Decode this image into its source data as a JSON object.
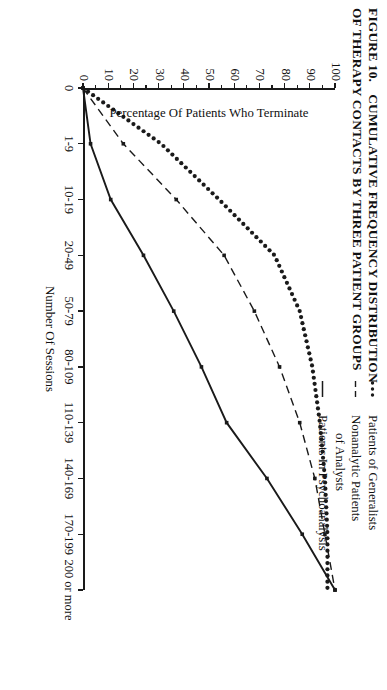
{
  "title": {
    "figure_number": "FIGURE 10.",
    "line1": "CUMULATIVE FREQUENCY DISTRIBUTION",
    "line2": "OF THERAPY CONTACTS BY THREE PATIENT GROUPS"
  },
  "axes": {
    "x_title": "Number Of Sessions",
    "y_title": "Percentage Of Patients Who Terminate",
    "x_categories": [
      "0",
      "1-9",
      "10-19",
      "20-49",
      "50-79",
      "80-109",
      "110-139",
      "140-169",
      "170-199",
      "200 or more"
    ],
    "y_ticks": [
      "0",
      "10",
      "20",
      "30",
      "40",
      "50",
      "60",
      "70",
      "80",
      "90",
      "100"
    ],
    "y_min": 0,
    "y_max": 100,
    "y_minor_step": 5
  },
  "legend": {
    "items": [
      {
        "marker": "dotted",
        "label_line1": "Patients of Generalists",
        "label_line2": ""
      },
      {
        "marker": "dashed",
        "label_line1": "Nonanalytic Patients",
        "label_line2": "of Analysts"
      },
      {
        "marker": "solid",
        "label_line1": "Patients In Psychoanalysis",
        "label_line2": ""
      }
    ]
  },
  "colors": {
    "ink": "#1a1a1a",
    "background": "#ffffff"
  },
  "chart_data": {
    "type": "line",
    "title": "CUMULATIVE FREQUENCY DISTRIBUTION OF THERAPY CONTACTS BY THREE PATIENT GROUPS",
    "xlabel": "Number Of Sessions",
    "ylabel": "Percentage Of Patients Who Terminate",
    "categories": [
      "0",
      "1-9",
      "10-19",
      "20-49",
      "50-79",
      "80-109",
      "110-139",
      "140-169",
      "170-199",
      "200 or more"
    ],
    "ylim": [
      0,
      100
    ],
    "grid": false,
    "legend_position": "top-right",
    "series": [
      {
        "name": "Patients of Generalists",
        "style": "dotted",
        "values": [
          0,
          31,
          54,
          76,
          86,
          91,
          94,
          96,
          97,
          97
        ]
      },
      {
        "name": "Nonanalytic Patients of Analysts",
        "style": "dashed",
        "values": [
          0,
          16,
          37,
          56,
          68,
          78,
          86,
          92,
          96,
          100
        ]
      },
      {
        "name": "Patients In Psychoanalysis",
        "style": "solid",
        "values": [
          0,
          3,
          11,
          24,
          36,
          47,
          57,
          73,
          87,
          100
        ]
      }
    ]
  }
}
